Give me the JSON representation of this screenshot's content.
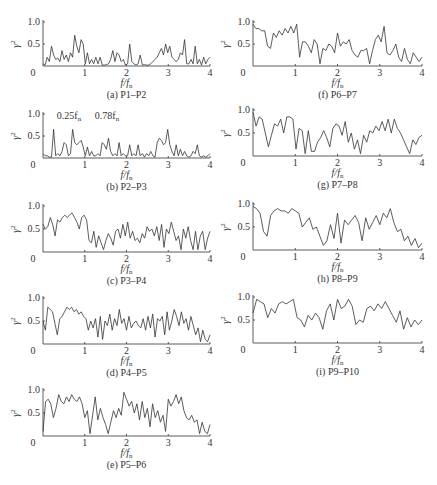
{
  "chart_data": [
    {
      "id": "a",
      "type": "line",
      "caption": "(a) P1–P2",
      "xlabel": "f/f_n",
      "ylabel": "γ²",
      "xlim": [
        0,
        4
      ],
      "ylim": [
        0,
        1
      ],
      "xticks": [
        "0",
        "1",
        "2",
        "3",
        "4"
      ],
      "yticks": [
        "1.0",
        "0.5"
      ],
      "values": [
        0.05,
        0.02,
        0.2,
        0.1,
        0.45,
        0.25,
        0.15,
        0.18,
        0.1,
        0.35,
        0.15,
        0.25,
        0.1,
        0.3,
        0.2,
        0.7,
        0.45,
        0.3,
        0.6,
        0.5,
        0.05,
        0.3,
        0.05,
        0.15,
        0.05,
        0.2,
        0.05,
        0.2,
        0.02,
        0.02,
        0.03,
        0.05,
        0.15,
        0.35,
        0.1,
        0.3,
        0.25,
        0.1,
        0.15,
        0.02,
        0.05,
        0.5,
        0.1,
        0.05,
        0.02,
        0.05,
        0.25,
        0.02,
        0.03,
        0.02,
        0.02,
        0.05,
        0.1,
        0.15,
        0.2,
        0.3,
        0.4,
        0.25,
        0.5,
        0.3,
        0.45,
        0.2,
        0.15,
        0.1,
        0.15,
        0.3,
        0.25,
        0.6,
        0.05,
        0.05,
        0.15,
        0.05,
        0.45,
        0.05,
        0.15,
        0.02,
        0.2,
        0.05,
        0.15,
        0.2
      ]
    },
    {
      "id": "b",
      "type": "line",
      "caption": "(b) P2–P3",
      "xlabel": "f/f_n",
      "ylabel": "γ²",
      "xlim": [
        0,
        4
      ],
      "ylim": [
        0,
        1
      ],
      "xticks": [
        "0",
        "1",
        "2",
        "3",
        "4"
      ],
      "yticks": [
        "1.0",
        "0.5"
      ],
      "annotations": [
        "0.25f_n",
        "0.78f_n"
      ],
      "values": [
        0.1,
        0.05,
        0.05,
        0.02,
        0.02,
        0.65,
        0.05,
        0.1,
        0.05,
        0.15,
        0.35,
        0.3,
        0.05,
        0.1,
        0.65,
        0.35,
        0.3,
        0.35,
        0.4,
        0.25,
        0.05,
        0.25,
        0.05,
        0.15,
        0.05,
        0.05,
        0.1,
        0.05,
        0.35,
        0.3,
        0.2,
        0.45,
        0.15,
        0.05,
        0.1,
        0.05,
        0.35,
        0.05,
        0.1,
        0.05,
        0.05,
        0.3,
        0.05,
        0.1,
        0.05,
        0.3,
        0.05,
        0.1,
        0.02,
        0.1,
        0.05,
        0.15,
        0.05,
        0.02,
        0.35,
        0.45,
        0.4,
        0.3,
        0.35,
        0.65,
        0.3,
        0.15,
        0.05,
        0.3,
        0.05,
        0.2,
        0.05,
        0.15,
        0.05,
        0.02,
        0.05,
        0.15,
        0.1,
        0.3,
        0.05,
        0.02,
        0.05,
        0.02,
        0.05,
        0.1
      ]
    },
    {
      "id": "c",
      "type": "line",
      "caption": "(c) P3–P4",
      "xlabel": "f/f_n",
      "ylabel": "γ²",
      "xlim": [
        0,
        4
      ],
      "ylim": [
        0,
        1
      ],
      "xticks": [
        "0",
        "1",
        "2",
        "3",
        "4"
      ],
      "yticks": [
        "1.0",
        "0.5"
      ],
      "values": [
        0.6,
        0.5,
        0.55,
        0.75,
        0.6,
        0.35,
        0.7,
        0.65,
        0.75,
        0.8,
        0.75,
        0.8,
        0.85,
        0.75,
        0.65,
        0.5,
        0.75,
        0.8,
        0.7,
        0.25,
        0.2,
        0.45,
        0.1,
        0.35,
        0.2,
        0.05,
        0.25,
        0.4,
        0.3,
        0.15,
        0.45,
        0.5,
        0.3,
        0.6,
        0.35,
        0.65,
        0.3,
        0.45,
        0.25,
        0.3,
        0.2,
        0.4,
        0.3,
        0.55,
        0.45,
        0.5,
        0.35,
        0.55,
        0.25,
        0.6,
        0.1,
        0.5,
        0.4,
        0.65,
        0.45,
        0.25,
        0.35,
        0.05,
        0.5,
        0.3,
        0.55,
        0.25,
        0.05,
        0.45,
        0.05,
        0.35,
        0.45,
        0.05,
        0.3,
        0.45
      ]
    },
    {
      "id": "d",
      "type": "line",
      "caption": "(d) P4–P5",
      "xlabel": "f/f_n",
      "ylabel": "γ²",
      "xlim": [
        0,
        4
      ],
      "ylim": [
        0,
        1
      ],
      "xticks": [
        "0",
        "1",
        "2",
        "3",
        "4"
      ],
      "yticks": [
        "1.0",
        "0.5"
      ],
      "values": [
        0.5,
        0.3,
        0.8,
        0.75,
        0.7,
        0.45,
        0.2,
        0.55,
        0.6,
        0.7,
        0.8,
        0.75,
        0.8,
        0.7,
        0.75,
        0.65,
        0.7,
        0.6,
        0.55,
        0.3,
        0.5,
        0.35,
        0.55,
        0.15,
        0.6,
        0.1,
        0.5,
        0.4,
        0.65,
        0.3,
        0.55,
        0.4,
        0.75,
        0.45,
        0.55,
        0.3,
        0.6,
        0.35,
        0.45,
        0.5,
        0.4,
        0.35,
        0.55,
        0.3,
        0.6,
        0.35,
        0.65,
        0.15,
        0.55,
        0.5,
        0.6,
        0.2,
        0.7,
        0.3,
        0.5,
        0.75,
        0.6,
        0.4,
        0.7,
        0.45,
        0.55,
        0.3,
        0.6,
        0.4,
        0.2,
        0.35,
        0.05,
        0.3,
        0.1,
        0.05,
        0.2
      ]
    },
    {
      "id": "e",
      "type": "line",
      "caption": "(e) P5–P6",
      "xlabel": "f/f_n",
      "ylabel": "γ²",
      "xlim": [
        0,
        4
      ],
      "ylim": [
        0,
        1
      ],
      "xticks": [
        "0",
        "1",
        "2",
        "3",
        "4"
      ],
      "yticks": [
        "1.0",
        "0.5"
      ],
      "values": [
        0.1,
        0.75,
        0.8,
        0.7,
        0.4,
        0.6,
        0.9,
        0.75,
        0.7,
        0.85,
        0.75,
        0.9,
        0.8,
        0.75,
        0.85,
        0.7,
        0.4,
        0.55,
        0.05,
        0.45,
        0.85,
        0.35,
        0.6,
        0.4,
        0.25,
        0.05,
        0.3,
        0.55,
        0.4,
        0.6,
        0.45,
        0.95,
        0.8,
        0.65,
        0.75,
        0.5,
        0.7,
        0.35,
        0.75,
        0.4,
        0.6,
        0.2,
        0.7,
        0.4,
        0.55,
        0.3,
        0.45,
        0.1,
        0.8,
        0.65,
        0.75,
        0.9,
        0.7,
        0.85,
        0.55,
        0.4,
        0.35,
        0.45,
        0.3,
        0.35,
        0.05,
        0.3,
        0.1,
        0.05,
        0.25
      ]
    },
    {
      "id": "f",
      "type": "line",
      "caption": "(f) P6–P7",
      "xlabel": "f/f_n",
      "ylabel": "γ²",
      "xlim": [
        0,
        4
      ],
      "ylim": [
        0,
        1
      ],
      "xticks": [
        "0",
        "1",
        "2",
        "3",
        "4"
      ],
      "yticks": [
        "1.0",
        "0.5"
      ],
      "values": [
        0.95,
        0.85,
        0.85,
        0.8,
        0.8,
        0.45,
        0.4,
        0.75,
        0.65,
        0.8,
        0.7,
        0.85,
        0.75,
        0.9,
        0.75,
        0.95,
        0.2,
        0.55,
        0.55,
        0.45,
        0.3,
        0.6,
        0.5,
        0.05,
        0.4,
        0.35,
        0.5,
        0.45,
        0.3,
        0.75,
        0.45,
        0.55,
        0.5,
        0.6,
        0.35,
        0.25,
        0.2,
        0.35,
        0.35,
        0.4,
        0.05,
        0.35,
        0.6,
        0.7,
        0.55,
        0.9,
        0.3,
        0.25,
        0.35,
        0.5,
        0.2,
        0.1,
        0.4,
        0.15,
        0.05,
        0.3,
        0.2,
        0.1,
        0.2
      ]
    },
    {
      "id": "g",
      "type": "line",
      "caption": "(g) P7–P8",
      "xlabel": "f/f_n",
      "ylabel": "γ²",
      "xlim": [
        0,
        4
      ],
      "ylim": [
        0,
        1
      ],
      "xticks": [
        "0",
        "1",
        "2",
        "3",
        "4"
      ],
      "yticks": [
        "1.0",
        "0.5"
      ],
      "values": [
        0.95,
        0.65,
        0.85,
        0.8,
        0.5,
        0.2,
        0.45,
        0.7,
        0.65,
        0.8,
        0.5,
        0.85,
        0.85,
        0.8,
        0.15,
        0.6,
        0.55,
        0.05,
        0.55,
        0.1,
        0.1,
        0.3,
        0.4,
        0.55,
        0.4,
        0.2,
        0.6,
        0.7,
        0.65,
        0.45,
        0.75,
        0.3,
        0.5,
        0.15,
        0.35,
        0.05,
        0.45,
        0.3,
        0.55,
        0.5,
        0.65,
        0.55,
        0.75,
        0.55,
        0.8,
        0.5,
        0.8,
        0.6,
        0.5,
        0.35,
        0.2,
        0.05,
        0.35,
        0.25,
        0.4,
        0.45
      ]
    },
    {
      "id": "h",
      "type": "line",
      "caption": "(h) P8–P9",
      "xlabel": "f/f_n",
      "ylabel": "γ²",
      "xlim": [
        0,
        4
      ],
      "ylim": [
        0,
        1
      ],
      "xticks": [
        "0",
        "1",
        "2",
        "3",
        "4"
      ],
      "yticks": [
        "1.0",
        "0.5"
      ],
      "values": [
        0.95,
        0.9,
        0.8,
        0.4,
        0.3,
        0.75,
        0.85,
        0.9,
        0.85,
        0.85,
        0.8,
        0.9,
        0.85,
        0.8,
        0.5,
        0.6,
        0.7,
        0.45,
        0.5,
        0.3,
        0.1,
        0.2,
        0.55,
        0.25,
        0.8,
        0.15,
        0.65,
        0.55,
        0.65,
        0.75,
        0.6,
        0.2,
        0.7,
        0.45,
        0.6,
        0.75,
        0.55,
        0.8,
        0.7,
        0.9,
        0.6,
        0.4,
        0.45,
        0.2,
        0.3,
        0.1,
        0.25,
        0.05,
        0.15
      ]
    },
    {
      "id": "i",
      "type": "line",
      "caption": "(i) P9–P10",
      "xlabel": "f/f_n",
      "ylabel": "γ²",
      "xlim": [
        0,
        4
      ],
      "ylim": [
        0,
        1
      ],
      "xticks": [
        "0",
        "1",
        "2",
        "3",
        "4"
      ],
      "yticks": [
        "1.0",
        "0.5"
      ],
      "values": [
        0.65,
        0.95,
        0.9,
        0.85,
        0.55,
        0.75,
        0.65,
        0.85,
        0.9,
        0.85,
        0.9,
        0.95,
        0.55,
        0.5,
        0.35,
        0.6,
        0.5,
        0.65,
        0.55,
        0.3,
        0.7,
        0.85,
        0.5,
        0.95,
        0.75,
        0.8,
        0.95,
        0.8,
        0.4,
        0.5,
        0.45,
        0.75,
        0.8,
        0.7,
        0.85,
        0.75,
        0.9,
        0.75,
        0.6,
        0.45,
        0.7,
        0.3,
        0.55,
        0.35,
        0.5,
        0.4,
        0.5
      ]
    }
  ],
  "figure": {
    "panels_left": [
      "a",
      "b",
      "c",
      "d",
      "e"
    ],
    "panels_right": [
      "f",
      "g",
      "h",
      "i"
    ]
  }
}
